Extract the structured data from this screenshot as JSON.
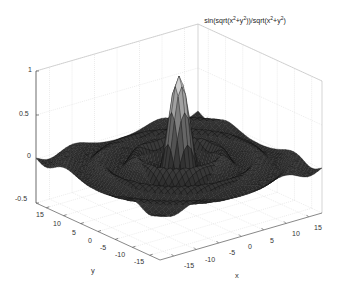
{
  "chart_data": {
    "type": "surface3d",
    "title_parts": {
      "a": "sin(sqrt(x",
      "b": "+y",
      "c": "))/sqrt(x",
      "d": "+y",
      "e": ")",
      "sup": "2"
    },
    "function": "z = sin(sqrt(x^2+y^2))/sqrt(x^2+y^2)",
    "xlabel": "x",
    "ylabel": "y",
    "zlabel": "",
    "xlim": [
      -18,
      18
    ],
    "ylim": [
      -18,
      18
    ],
    "zlim": [
      -0.5,
      1
    ],
    "x_ticks": [
      "-15",
      "-10",
      "-5",
      "0",
      "5",
      "10",
      "15"
    ],
    "y_ticks": [
      "15",
      "10",
      "5",
      "0",
      "-5",
      "-10",
      "-15"
    ],
    "z_ticks": [
      "1",
      "0.5",
      "0",
      "-0.5"
    ],
    "grid": true,
    "colormap": "gray",
    "peak": {
      "x": 0,
      "y": 0,
      "z": 1
    },
    "legend": null
  }
}
